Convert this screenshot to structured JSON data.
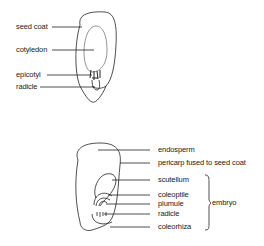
{
  "dicot_seed": {
    "labels": {
      "seed_coat": "seed coat",
      "cotyledon": "cotyledon",
      "epicotyl": "epicotyl",
      "radicle": "radicle"
    }
  },
  "monocot_seed": {
    "labels": {
      "endosperm": "endosperm",
      "pericarp": "pericarp fused to seed coat",
      "scutellum": "scutellum",
      "coleoptile": "coleoptile",
      "plumule": "plumule",
      "radicle": "radicle",
      "coleorhiza": "coleorhiza",
      "embryo": "embryo"
    }
  },
  "colors": {
    "line": "#222222",
    "background": "#ffffff"
  }
}
